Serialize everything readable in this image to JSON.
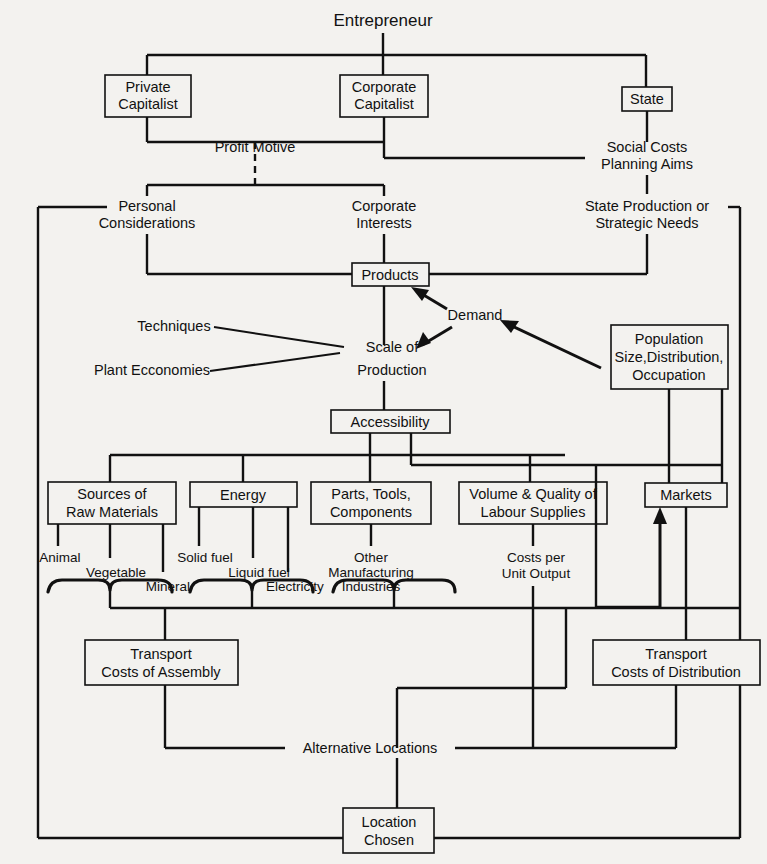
{
  "diagram": {
    "title": "Entrepreneur",
    "nodes": {
      "entrepreneur": "Entrepreneur",
      "private_capitalist": "Private\nCapitalist",
      "private_capitalist_l1": "Private",
      "private_capitalist_l2": "Capitalist",
      "corporate_capitalist_l1": "Corporate",
      "corporate_capitalist_l2": "Capitalist",
      "state": "State",
      "profit_motive": "Profit  Motive",
      "social_costs_l1": "Social Costs",
      "social_costs_l2": "Planning Aims",
      "personal_considerations_l1": "Personal",
      "personal_considerations_l2": "Considerations",
      "corporate_interests_l1": "Corporate",
      "corporate_interests_l2": "Interests",
      "state_production_l1": "State Production or",
      "state_production_l2": "Strategic Needs",
      "products": "Products",
      "demand": "Demand",
      "techniques": "Techniques",
      "plant_economies": "Plant Ecconomies",
      "scale_of_production_l1": "Scale of",
      "scale_of_production_l2": "Production",
      "population_l1": "Population",
      "population_l2": "Size,Distribution,",
      "population_l3": "Occupation",
      "accessibility": "Accessibility",
      "sources_raw_materials_l1": "Sources of",
      "sources_raw_materials_l2": "Raw  Materials",
      "energy": "Energy",
      "parts_tools_l1": "Parts, Tools,",
      "parts_tools_l2": "Components",
      "volume_quality_l1": "Volume & Quality of",
      "volume_quality_l2": "Labour  Supplies",
      "markets": "Markets",
      "animal": "Animal",
      "vegetable": "Vegetable",
      "mineral": "Mineral",
      "solid_fuel": "Solid fuel",
      "liquid_fuel": "Liquid fuel",
      "electricity": "Electricity",
      "other_manufacturing_l1": "Other",
      "other_manufacturing_l2": "Manufacturing",
      "other_manufacturing_l3": "Industries",
      "costs_per_unit_l1": "Costs per",
      "costs_per_unit_l2": "Unit Output",
      "transport_assembly_l1": "Transport",
      "transport_assembly_l2": "Costs of  Assembly",
      "transport_distribution_l1": "Transport",
      "transport_distribution_l2": "Costs of Distribution",
      "alternative_locations": "Alternative   Locations",
      "location_chosen_l1": "Location",
      "location_chosen_l2": "Chosen"
    },
    "colors": {
      "background": "#f3f2ef",
      "ink": "#111111"
    }
  }
}
